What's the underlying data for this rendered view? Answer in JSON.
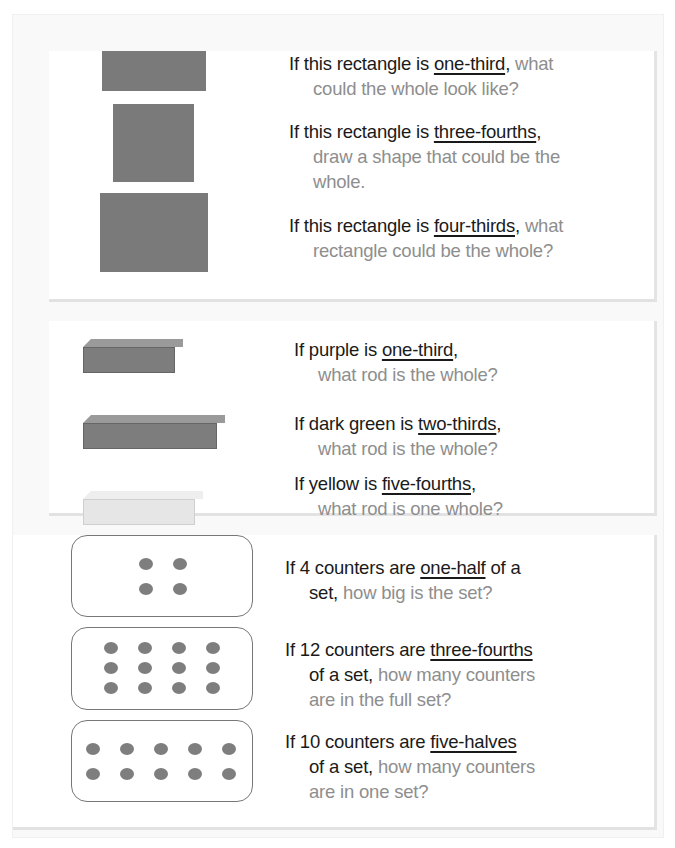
{
  "section_rectangles": {
    "items": [
      {
        "lead": "If this rectangle is ",
        "fraction": "one-third",
        "after": ",",
        "tail_gray": " what",
        "line2_dark": "",
        "line2_gray": "could the whole look like?",
        "line3_gray": ""
      },
      {
        "lead": "If this rectangle is ",
        "fraction": "three-fourths",
        "after": ",",
        "tail_gray": "",
        "line2_dark": "",
        "line2_gray": "draw a shape that could be the",
        "line3_gray": "whole."
      },
      {
        "lead": "If this rectangle is ",
        "fraction": "four-thirds",
        "after": ",",
        "tail_gray": " what",
        "line2_dark": "",
        "line2_gray": "rectangle could be the whole?",
        "line3_gray": ""
      }
    ],
    "shape_color": "#7a7a7a"
  },
  "section_rods": {
    "items": [
      {
        "lead": "If purple is ",
        "fraction": "one-third",
        "after": ",",
        "line2_gray": "what rod is the whole?",
        "rod_color": "#7d7d7d"
      },
      {
        "lead": "If dark green is ",
        "fraction": "two-thirds",
        "after": ",",
        "line2_gray": "what rod is the whole?",
        "rod_color": "#7d7d7d"
      },
      {
        "lead": "If yellow is ",
        "fraction": "five-fourths",
        "after": ",",
        "line2_gray": "what rod is one whole?",
        "rod_color": "#e6e6e6"
      }
    ]
  },
  "section_counters": {
    "items": [
      {
        "lead": "If 4 counters are ",
        "fraction": "one-half",
        "after": " of a",
        "line2_dark": "set,",
        "line2_gray": " how big is the set?",
        "line3_gray": "",
        "counters": 4
      },
      {
        "lead": "If 12 counters are ",
        "fraction": "three-fourths",
        "after": "",
        "line2_dark": "of a set,",
        "line2_gray": " how many counters",
        "line3_gray": "are in the full set?",
        "counters": 12
      },
      {
        "lead": "If 10 counters are ",
        "fraction": "five-halves",
        "after": "",
        "line2_dark": "of a set,",
        "line2_gray": " how many counters",
        "line3_gray": "are in one set?",
        "counters": 10
      }
    ]
  }
}
